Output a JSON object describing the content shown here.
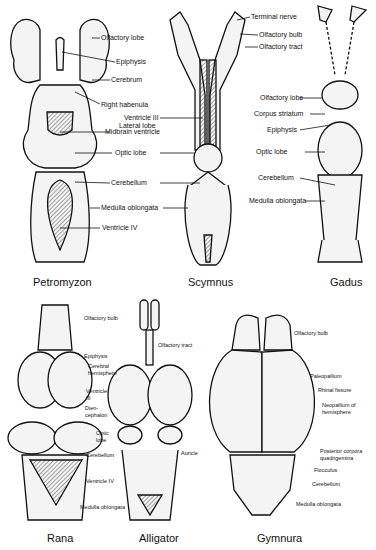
{
  "figure": {
    "panels": [
      {
        "name": "Petromyzon",
        "labels": [
          "Olfactory lobe",
          "Epiphysis",
          "Cerebrum",
          "Right habenula",
          "Midbrain ventricle",
          "Optic lobe",
          "Cerebellum",
          "Medulla oblongata",
          "Ventricle IV"
        ]
      },
      {
        "name": "Scymnus",
        "labels": [
          "Terminal nerve",
          "Olfactory bulb",
          "Olfactory tract",
          "Ventricle III",
          "Lateral lobe"
        ]
      },
      {
        "name": "Gadus",
        "labels": [
          "Olfactory lobe",
          "Corpus striatum",
          "Epiphysis",
          "Optic lobe",
          "Cerebellum",
          "Medulla oblongata"
        ]
      },
      {
        "name": "Rana",
        "labels": [
          "Olfactory bulb",
          "Epiphysis",
          "Cerebral hemisphere",
          "Ventricle III",
          "Dien-cephalon",
          "Optic lobe",
          "Cerebellum",
          "Ventricle IV",
          "Medulla oblongata"
        ]
      },
      {
        "name": "Alligator",
        "labels": [
          "Olfactory tract",
          "Auricle"
        ]
      },
      {
        "name": "Gymnura",
        "labels": [
          "Olfactory bulb",
          "Paleopallium",
          "Rhinal fissure",
          "Neopallium of hemisphere",
          "Posterior corpora quadrigemina",
          "Flocculus",
          "Cerebellum",
          "Medulla oblongata"
        ]
      }
    ]
  }
}
